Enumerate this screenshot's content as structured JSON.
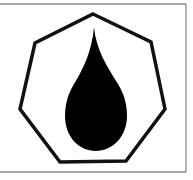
{
  "symbol": {
    "name": "oil-drop-in-heptagon",
    "description": "Black liquid drop inside a heptagon outline, framed",
    "colors": {
      "background": "#ffffff",
      "frame": "#8a8a8a",
      "outline": "#111111",
      "drop": "#000000"
    }
  }
}
